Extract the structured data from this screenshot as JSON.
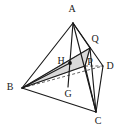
{
  "figure": {
    "kind": "geometry-diagram",
    "background_color": "#ffffff",
    "stroke_color": "#1a1a1a",
    "shade_color": "#d9d9d9",
    "shade_stroke_color": "#8c8c8c",
    "dash_color": "#3a3a3a",
    "width": 119,
    "height": 130,
    "labels": {
      "A": "A",
      "B": "B",
      "C": "C",
      "D": "D",
      "G": "G",
      "H": "H",
      "P": "P",
      "Q": "Q"
    },
    "points": {
      "A": {
        "x": 73,
        "y": 23,
        "label_x": 72,
        "label_y": 10
      },
      "B": {
        "x": 22,
        "y": 88,
        "label_x": 10,
        "label_y": 88
      },
      "C": {
        "x": 96,
        "y": 112,
        "label_x": 98,
        "label_y": 122
      },
      "D": {
        "x": 103,
        "y": 66,
        "label_x": 110,
        "label_y": 67
      },
      "G": {
        "x": 68,
        "y": 87,
        "label_x": 68,
        "label_y": 95
      },
      "H": {
        "x": 70,
        "y": 63,
        "label_x": 61,
        "label_y": 62
      },
      "P": {
        "x": 85,
        "y": 66,
        "label_x": 90,
        "label_y": 63
      },
      "Q": {
        "x": 90,
        "y": 48,
        "label_x": 95,
        "label_y": 40
      }
    },
    "edges_solid": [
      {
        "name": "A-B",
        "from": "A",
        "to": "B"
      },
      {
        "name": "A-C",
        "from": "A",
        "to": "C"
      },
      {
        "name": "A-D",
        "from": "A",
        "to": "D"
      },
      {
        "name": "B-C",
        "from": "B",
        "to": "C"
      },
      {
        "name": "C-D",
        "from": "C",
        "to": "D"
      },
      {
        "name": "A-Q",
        "from": "A",
        "to": "Q"
      },
      {
        "name": "Q-P",
        "from": "Q",
        "to": "P"
      },
      {
        "name": "Q-C",
        "from": "Q",
        "to": "C"
      },
      {
        "name": "P-C",
        "from": "P",
        "to": "C"
      },
      {
        "name": "B-H",
        "from": "B",
        "to": "H"
      },
      {
        "name": "B-P",
        "from": "B",
        "to": "P"
      },
      {
        "name": "B-Q",
        "from": "B",
        "to": "Q"
      },
      {
        "name": "A-G",
        "from": "A",
        "to": "G"
      }
    ],
    "edges_dashed": [
      {
        "name": "B-D",
        "from": "B",
        "to": "D"
      },
      {
        "name": "P-D",
        "from": "P",
        "to": "D"
      }
    ],
    "shaded_region": {
      "name": "triangle-BHQ-P",
      "vertices": [
        "B",
        "Q",
        "P"
      ]
    },
    "marked_points": [
      {
        "name": "H",
        "x": 70,
        "y": 63,
        "r": 1.9
      }
    ]
  }
}
